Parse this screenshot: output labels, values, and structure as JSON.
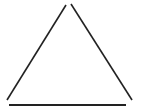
{
  "figure": {
    "shape": "triangle",
    "stroke_color": "#222222",
    "background": "#ffffff",
    "segments": [
      {
        "name": "left-side",
        "x1": 7,
        "y1": 100,
        "x2": 66,
        "y2": 5,
        "width": 1.6
      },
      {
        "name": "right-side",
        "x1": 71,
        "y1": 4,
        "x2": 132,
        "y2": 100,
        "width": 1.6
      },
      {
        "name": "base",
        "x1": 9,
        "y1": 105,
        "x2": 126,
        "y2": 105,
        "width": 2
      }
    ]
  }
}
